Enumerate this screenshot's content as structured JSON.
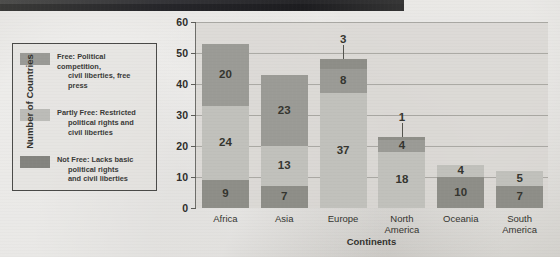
{
  "legend": {
    "items": [
      {
        "swatch": "free",
        "label": "Free: Political competition,",
        "line2": "civil liberties, free",
        "line3": "press"
      },
      {
        "swatch": "partly",
        "label": "Partly Free: Restricted",
        "line2": "political rights and",
        "line3": "civil liberties"
      },
      {
        "swatch": "not",
        "label": "Not Free: Lacks basic",
        "line2": "political rights",
        "line3": "and civil liberties"
      }
    ]
  },
  "chart_data": {
    "type": "bar",
    "stacked": true,
    "title": "",
    "xlabel": "Continents",
    "ylabel": "Number of Countries",
    "ylim": [
      0,
      60
    ],
    "yticks": [
      0,
      10,
      20,
      30,
      40,
      50,
      60
    ],
    "grid": true,
    "legend_position": "left-outside",
    "categories": [
      "Africa",
      "Asia",
      "Europe",
      "North\nAmerica",
      "Oceania",
      "South\nAmerica"
    ],
    "series": [
      {
        "name": "Not Free",
        "color": "#8e8e88",
        "values": [
          9,
          7,
          0,
          0,
          10,
          7
        ]
      },
      {
        "name": "Partly Free",
        "color": "#c1c1bc",
        "values": [
          24,
          13,
          37,
          18,
          4,
          5
        ]
      },
      {
        "name": "Free",
        "color": "#9b9b96",
        "values": [
          20,
          23,
          8,
          4,
          0,
          0
        ]
      }
    ],
    "extra_top_segments": [
      {
        "category": "Europe",
        "value": 3,
        "color": "#8e8e88",
        "label_outside": true
      },
      {
        "category": "North\nAmerica",
        "value": 1,
        "color": "#8e8e88",
        "label_outside": true
      }
    ],
    "totals": [
      53,
      43,
      48,
      23,
      14,
      12
    ]
  },
  "colors": {
    "free": "#9b9b96",
    "partly": "#c1c1bc",
    "not_free": "#8e8e88",
    "paper": "#d8d6d2",
    "ink": "#2b2b2b"
  }
}
